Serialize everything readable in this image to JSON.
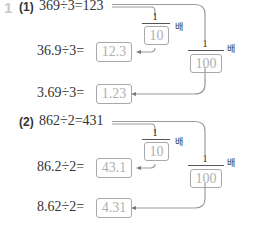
{
  "problem_number": "1",
  "parts": [
    {
      "label": "(1)",
      "base_equation": "369÷3=123",
      "rows": [
        {
          "equation": "36.9÷3=",
          "answer": "12.3"
        },
        {
          "equation": "3.69÷3=",
          "answer": "1.23"
        }
      ],
      "fractions": [
        {
          "numerator": "1",
          "denominator": "10",
          "unit": "배"
        },
        {
          "numerator": "1",
          "denominator": "100",
          "unit": "배"
        }
      ]
    },
    {
      "label": "(2)",
      "base_equation": "862÷2=431",
      "rows": [
        {
          "equation": "86.2÷2=",
          "answer": "43.1"
        },
        {
          "equation": "8.62÷2=",
          "answer": "4.31"
        }
      ],
      "fractions": [
        {
          "numerator": "1",
          "denominator": "10",
          "unit": "배"
        },
        {
          "numerator": "1",
          "denominator": "100",
          "unit": "배"
        }
      ]
    }
  ]
}
